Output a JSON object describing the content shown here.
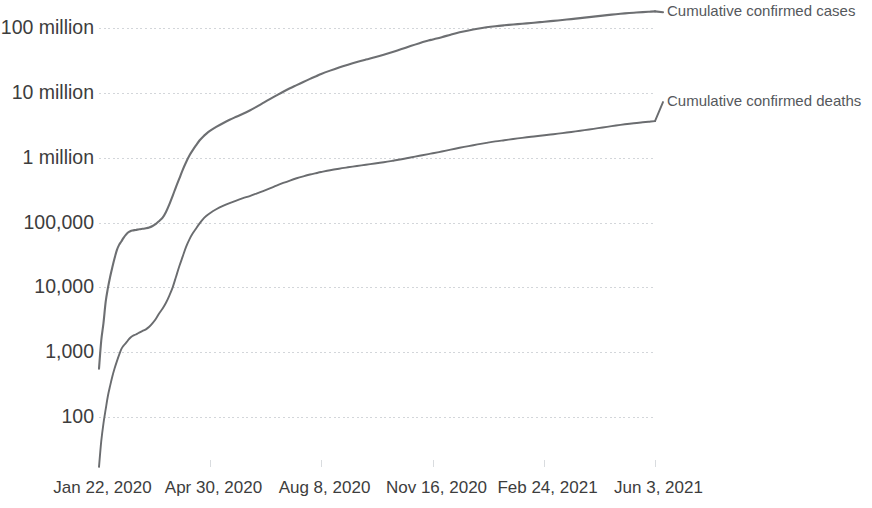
{
  "chart_data": {
    "type": "line",
    "title": "",
    "subtitle": "",
    "xlabel": "",
    "ylabel": "",
    "yscale": "log",
    "grid": true,
    "ylim": [
      30,
      300000000
    ],
    "y_ticks": [
      {
        "value": 100000000,
        "label": "100 million"
      },
      {
        "value": 10000000,
        "label": "10 million"
      },
      {
        "value": 1000000,
        "label": "1 million"
      },
      {
        "value": 100000,
        "label": "100,000"
      },
      {
        "value": 10000,
        "label": "10,000"
      },
      {
        "value": 1000,
        "label": "1,000"
      },
      {
        "value": 100,
        "label": "100"
      }
    ],
    "x_ticks": [
      {
        "index": 0,
        "label": "Jan 22, 2020"
      },
      {
        "index": 99,
        "label": "Apr 30, 2020"
      },
      {
        "index": 199,
        "label": "Aug 8, 2020"
      },
      {
        "index": 299,
        "label": "Nov 16, 2020"
      },
      {
        "index": 399,
        "label": "Feb 24, 2021"
      },
      {
        "index": 498,
        "label": "Jun 3, 2021"
      }
    ],
    "x_range": [
      "Jan 22, 2020",
      "Jun 3, 2021"
    ],
    "legend_position": "right-inline",
    "series": [
      {
        "name": "Cumulative confirmed cases",
        "label": "Cumulative confirmed cases",
        "color": "#6d6f72",
        "label_value": 175000000,
        "points": [
          [
            0,
            555
          ],
          [
            2,
            1500
          ],
          [
            4,
            2800
          ],
          [
            6,
            6000
          ],
          [
            8,
            9800
          ],
          [
            10,
            14600
          ],
          [
            12,
            20600
          ],
          [
            14,
            28300
          ],
          [
            16,
            37500
          ],
          [
            18,
            45200
          ],
          [
            20,
            51000
          ],
          [
            22,
            58000
          ],
          [
            24,
            64500
          ],
          [
            26,
            70000
          ],
          [
            28,
            73300
          ],
          [
            30,
            75200
          ],
          [
            33,
            76800
          ],
          [
            36,
            78600
          ],
          [
            39,
            79900
          ],
          [
            42,
            81300
          ],
          [
            45,
            83700
          ],
          [
            48,
            88400
          ],
          [
            51,
            95300
          ],
          [
            54,
            105800
          ],
          [
            57,
            118900
          ],
          [
            60,
            145400
          ],
          [
            63,
            190000
          ],
          [
            66,
            258000
          ],
          [
            69,
            355000
          ],
          [
            72,
            480000
          ],
          [
            75,
            650000
          ],
          [
            78,
            850000
          ],
          [
            81,
            1080000
          ],
          [
            84,
            1310000
          ],
          [
            87,
            1560000
          ],
          [
            90,
            1840000
          ],
          [
            93,
            2090000
          ],
          [
            96,
            2330000
          ],
          [
            99,
            2560000
          ],
          [
            105,
            2980000
          ],
          [
            111,
            3400000
          ],
          [
            117,
            3840000
          ],
          [
            123,
            4280000
          ],
          [
            129,
            4760000
          ],
          [
            135,
            5340000
          ],
          [
            141,
            6080000
          ],
          [
            147,
            6980000
          ],
          [
            153,
            8000000
          ],
          [
            159,
            9130000
          ],
          [
            165,
            10400000
          ],
          [
            171,
            11750000
          ],
          [
            177,
            13150000
          ],
          [
            183,
            14700000
          ],
          [
            189,
            16400000
          ],
          [
            195,
            18200000
          ],
          [
            199,
            19500000
          ],
          [
            207,
            22000000
          ],
          [
            215,
            24600000
          ],
          [
            223,
            27200000
          ],
          [
            231,
            29900000
          ],
          [
            239,
            32600000
          ],
          [
            247,
            35400000
          ],
          [
            255,
            38700000
          ],
          [
            263,
            42600000
          ],
          [
            271,
            47300000
          ],
          [
            279,
            52800000
          ],
          [
            287,
            58400000
          ],
          [
            295,
            63900000
          ],
          [
            299,
            66600000
          ],
          [
            307,
            72200000
          ],
          [
            315,
            78900000
          ],
          [
            323,
            85700000
          ],
          [
            331,
            91800000
          ],
          [
            339,
            97500000
          ],
          [
            347,
            102500000
          ],
          [
            355,
            106600000
          ],
          [
            363,
            110000000
          ],
          [
            371,
            113200000
          ],
          [
            379,
            116300000
          ],
          [
            387,
            119600000
          ],
          [
            395,
            123200000
          ],
          [
            399,
            125000000
          ],
          [
            407,
            128800000
          ],
          [
            415,
            132800000
          ],
          [
            423,
            137200000
          ],
          [
            431,
            142000000
          ],
          [
            439,
            147200000
          ],
          [
            447,
            152500000
          ],
          [
            455,
            157800000
          ],
          [
            463,
            163100000
          ],
          [
            471,
            168000000
          ],
          [
            479,
            172300000
          ],
          [
            487,
            176000000
          ],
          [
            493,
            178500000
          ],
          [
            498,
            180600000
          ]
        ]
      },
      {
        "name": "Cumulative confirmed deaths",
        "label": "Cumulative confirmed deaths",
        "color": "#6a6c6f",
        "label_value": 7200000,
        "points": [
          [
            0,
            17
          ],
          [
            2,
            42
          ],
          [
            4,
            80
          ],
          [
            6,
            132
          ],
          [
            8,
            213
          ],
          [
            10,
            305
          ],
          [
            12,
            425
          ],
          [
            14,
            564
          ],
          [
            16,
            722
          ],
          [
            18,
            908
          ],
          [
            20,
            1115
          ],
          [
            22,
            1262
          ],
          [
            24,
            1383
          ],
          [
            26,
            1526
          ],
          [
            28,
            1669
          ],
          [
            30,
            1775
          ],
          [
            33,
            1873
          ],
          [
            36,
            2007
          ],
          [
            39,
            2126
          ],
          [
            42,
            2247
          ],
          [
            45,
            2462
          ],
          [
            48,
            2800
          ],
          [
            51,
            3280
          ],
          [
            54,
            3990
          ],
          [
            57,
            4720
          ],
          [
            60,
            5780
          ],
          [
            63,
            7480
          ],
          [
            66,
            10000
          ],
          [
            69,
            14600
          ],
          [
            72,
            21300
          ],
          [
            75,
            30000
          ],
          [
            78,
            42100
          ],
          [
            81,
            55000
          ],
          [
            84,
            68000
          ],
          [
            87,
            81000
          ],
          [
            90,
            96000
          ],
          [
            93,
            112000
          ],
          [
            96,
            126000
          ],
          [
            99,
            138000
          ],
          [
            105,
            160000
          ],
          [
            111,
            180000
          ],
          [
            117,
            199000
          ],
          [
            123,
            218000
          ],
          [
            129,
            237000
          ],
          [
            135,
            256000
          ],
          [
            141,
            279000
          ],
          [
            147,
            305000
          ],
          [
            153,
            335000
          ],
          [
            159,
            371000
          ],
          [
            165,
            407000
          ],
          [
            171,
            444000
          ],
          [
            177,
            481000
          ],
          [
            183,
            516000
          ],
          [
            189,
            550000
          ],
          [
            195,
            580000
          ],
          [
            199,
            600000
          ],
          [
            207,
            640000
          ],
          [
            215,
            676000
          ],
          [
            223,
            710000
          ],
          [
            231,
            744000
          ],
          [
            239,
            778000
          ],
          [
            247,
            812000
          ],
          [
            255,
            850000
          ],
          [
            263,
            895000
          ],
          [
            271,
            945000
          ],
          [
            279,
            1005000
          ],
          [
            287,
            1070000
          ],
          [
            295,
            1135000
          ],
          [
            299,
            1170000
          ],
          [
            307,
            1245000
          ],
          [
            315,
            1330000
          ],
          [
            323,
            1420000
          ],
          [
            331,
            1510000
          ],
          [
            339,
            1600000
          ],
          [
            347,
            1690000
          ],
          [
            355,
            1780000
          ],
          [
            363,
            1860000
          ],
          [
            371,
            1940000
          ],
          [
            379,
            2020000
          ],
          [
            387,
            2100000
          ],
          [
            395,
            2180000
          ],
          [
            399,
            2220000
          ],
          [
            407,
            2300000
          ],
          [
            415,
            2390000
          ],
          [
            423,
            2490000
          ],
          [
            431,
            2600000
          ],
          [
            439,
            2720000
          ],
          [
            447,
            2850000
          ],
          [
            455,
            2990000
          ],
          [
            463,
            3130000
          ],
          [
            471,
            3270000
          ],
          [
            479,
            3400000
          ],
          [
            487,
            3510000
          ],
          [
            493,
            3590000
          ],
          [
            498,
            3660000
          ]
        ]
      }
    ]
  },
  "colors": {
    "line": "#6d6f72",
    "grid": "#d3d6da",
    "text": "#3d3d3d",
    "legend_text": "#55585c",
    "background": "#ffffff"
  }
}
